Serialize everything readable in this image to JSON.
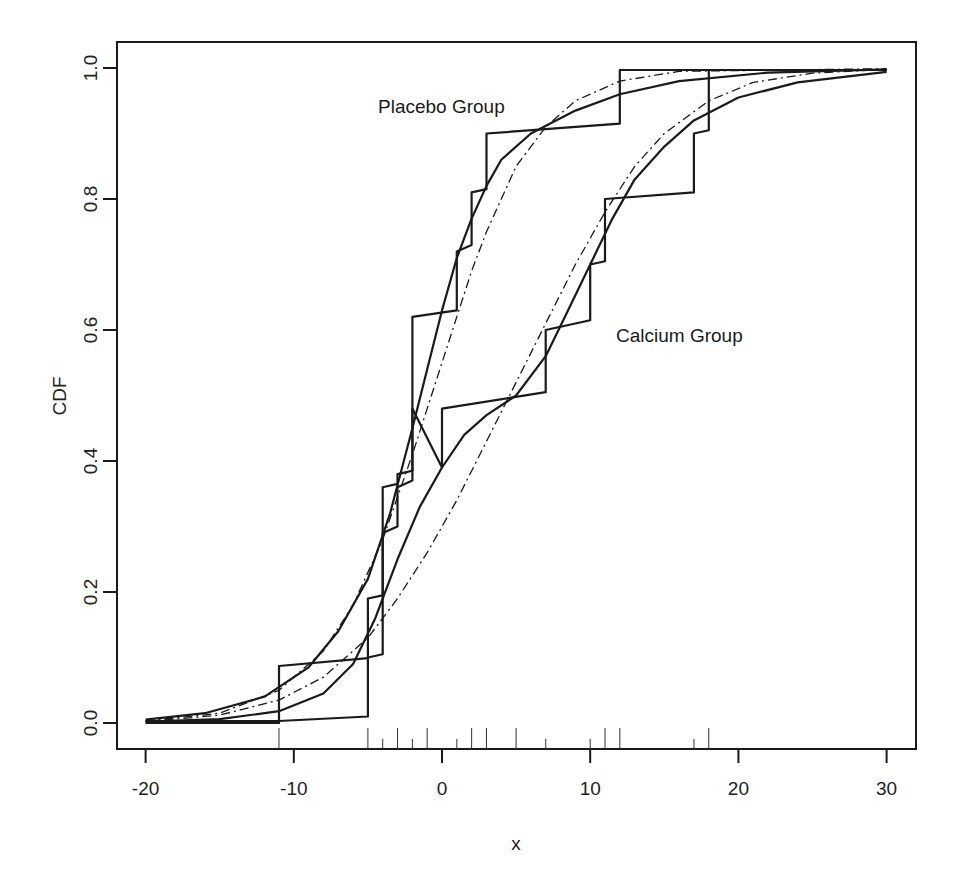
{
  "chart_data": {
    "type": "line",
    "title": "",
    "xlabel": "x",
    "ylabel": "CDF",
    "xlim": [
      -22,
      32
    ],
    "ylim": [
      -0.04,
      1.04
    ],
    "x_ticks": [
      -20,
      -10,
      0,
      10,
      20,
      30
    ],
    "x_tick_labels": [
      "-20",
      "-10",
      "0",
      "10",
      "20",
      "30"
    ],
    "y_ticks": [
      0.0,
      0.2,
      0.4,
      0.6,
      0.8,
      1.0
    ],
    "y_tick_labels": [
      "0.0",
      "0.2",
      "0.4",
      "0.6",
      "0.8",
      "1.0"
    ],
    "grid": false,
    "legend": null,
    "annotations": [
      {
        "text": "Placebo Group",
        "x": -4.5,
        "y": 0.945
      },
      {
        "text": "Calcium Group",
        "x": 11.8,
        "y": 0.59
      }
    ],
    "rug": {
      "long": [
        -11,
        -5,
        -3,
        -1,
        2,
        3,
        5,
        11,
        12,
        18
      ],
      "short": [
        -4,
        -2,
        1,
        7,
        10,
        17
      ]
    },
    "series": [
      {
        "name": "Placebo Group empirical (zig-zag)",
        "style": "solid",
        "points": [
          [
            -20,
            0.003
          ],
          [
            -11,
            0.003
          ],
          [
            -11,
            0.087
          ],
          [
            -5,
            0.099
          ],
          [
            -5,
            0.19
          ],
          [
            -4,
            0.195
          ],
          [
            -4,
            0.36
          ],
          [
            -3,
            0.365
          ],
          [
            -3,
            0.38
          ],
          [
            -2,
            0.385
          ],
          [
            -2,
            0.62
          ],
          [
            1,
            0.63
          ],
          [
            1,
            0.72
          ],
          [
            2,
            0.73
          ],
          [
            2,
            0.81
          ],
          [
            3,
            0.815
          ],
          [
            3,
            0.9
          ],
          [
            12,
            0.915
          ],
          [
            12,
            0.997
          ],
          [
            30,
            0.997
          ]
        ]
      },
      {
        "name": "Calcium Group empirical (zig-zag)",
        "style": "solid",
        "points": [
          [
            -20,
            0.0
          ],
          [
            -11,
            0.0
          ],
          [
            -11,
            0.003
          ],
          [
            -5,
            0.01
          ],
          [
            -5,
            0.1
          ],
          [
            -4,
            0.105
          ],
          [
            -4,
            0.29
          ],
          [
            -3,
            0.3
          ],
          [
            -3,
            0.36
          ],
          [
            -2,
            0.37
          ],
          [
            -2,
            0.48
          ],
          [
            0,
            0.39
          ],
          [
            0,
            0.48
          ],
          [
            7,
            0.505
          ],
          [
            7,
            0.6
          ],
          [
            10,
            0.615
          ],
          [
            10,
            0.7
          ],
          [
            11,
            0.705
          ],
          [
            11,
            0.8
          ],
          [
            17,
            0.81
          ],
          [
            17,
            0.9
          ],
          [
            18,
            0.905
          ],
          [
            18,
            0.997
          ],
          [
            30,
            0.997
          ]
        ]
      },
      {
        "name": "Placebo Group smooth CDF",
        "style": "solid",
        "points": [
          [
            -20,
            0.005
          ],
          [
            -16,
            0.015
          ],
          [
            -12,
            0.04
          ],
          [
            -9,
            0.085
          ],
          [
            -7,
            0.14
          ],
          [
            -5,
            0.22
          ],
          [
            -3.5,
            0.32
          ],
          [
            -2,
            0.45
          ],
          [
            -1,
            0.54
          ],
          [
            0,
            0.63
          ],
          [
            1,
            0.71
          ],
          [
            2,
            0.77
          ],
          [
            3,
            0.82
          ],
          [
            4,
            0.86
          ],
          [
            6,
            0.9
          ],
          [
            9,
            0.935
          ],
          [
            12,
            0.96
          ],
          [
            16,
            0.98
          ],
          [
            22,
            0.993
          ],
          [
            30,
            0.998
          ]
        ]
      },
      {
        "name": "Calcium Group smooth CDF",
        "style": "solid",
        "points": [
          [
            -20,
            0.002
          ],
          [
            -15,
            0.006
          ],
          [
            -11,
            0.018
          ],
          [
            -8,
            0.045
          ],
          [
            -6,
            0.09
          ],
          [
            -4.5,
            0.16
          ],
          [
            -3,
            0.25
          ],
          [
            -1.5,
            0.33
          ],
          [
            0,
            0.39
          ],
          [
            1.5,
            0.44
          ],
          [
            3,
            0.47
          ],
          [
            5,
            0.5
          ],
          [
            7,
            0.56
          ],
          [
            8.5,
            0.63
          ],
          [
            10,
            0.7
          ],
          [
            11.5,
            0.77
          ],
          [
            13,
            0.83
          ],
          [
            15,
            0.88
          ],
          [
            17,
            0.92
          ],
          [
            20,
            0.955
          ],
          [
            24,
            0.978
          ],
          [
            30,
            0.994
          ]
        ]
      },
      {
        "name": "Placebo Group normal fit",
        "style": "dashdot",
        "points": [
          [
            -20,
            0.003
          ],
          [
            -15,
            0.015
          ],
          [
            -11,
            0.05
          ],
          [
            -8,
            0.11
          ],
          [
            -6,
            0.18
          ],
          [
            -4,
            0.28
          ],
          [
            -2,
            0.41
          ],
          [
            -1,
            0.48
          ],
          [
            0,
            0.55
          ],
          [
            1,
            0.62
          ],
          [
            2,
            0.69
          ],
          [
            3,
            0.75
          ],
          [
            4,
            0.8
          ],
          [
            5,
            0.85
          ],
          [
            7,
            0.91
          ],
          [
            9,
            0.95
          ],
          [
            12,
            0.98
          ],
          [
            16,
            0.995
          ],
          [
            30,
            0.999
          ]
        ]
      },
      {
        "name": "Calcium Group normal fit",
        "style": "dashdot",
        "points": [
          [
            -20,
            0.002
          ],
          [
            -15,
            0.012
          ],
          [
            -11,
            0.035
          ],
          [
            -8,
            0.07
          ],
          [
            -5,
            0.13
          ],
          [
            -3,
            0.19
          ],
          [
            -1,
            0.26
          ],
          [
            1,
            0.34
          ],
          [
            3,
            0.43
          ],
          [
            5,
            0.52
          ],
          [
            7,
            0.61
          ],
          [
            9,
            0.7
          ],
          [
            11,
            0.78
          ],
          [
            13,
            0.85
          ],
          [
            15,
            0.9
          ],
          [
            18,
            0.95
          ],
          [
            21,
            0.978
          ],
          [
            25,
            0.992
          ],
          [
            30,
            0.998
          ]
        ]
      }
    ]
  },
  "axes": {
    "xlabel": "x",
    "ylabel": "CDF"
  },
  "labels": {
    "placebo": "Placebo Group",
    "calcium": "Calcium Group"
  }
}
